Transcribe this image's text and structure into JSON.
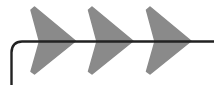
{
  "figure": {
    "title": "",
    "type": "flow-direction-diagram",
    "width": 214,
    "height": 85,
    "background_color": "#ffffff"
  },
  "colors": {
    "chevron_fill": "#8a8a8a",
    "line_stroke": "#222222",
    "background": "#ffffff"
  },
  "path_line": {
    "name": "flow-line",
    "stroke_width": 2.4,
    "description": "horizontal line running to the right edge, curving downward at the left end into a vertical tail",
    "d": "M214 41.5 L22 41.5 C15.5 41.5 11.5 45.5 11.5 52.5 L11.5 85"
  },
  "chevrons": [
    {
      "name": "chevron-1",
      "points": "34.5,7 75.5,41 34.5,74 31,71.5 39.5,41.5 31,10",
      "tip_x": 75.5,
      "tip_y": 41
    },
    {
      "name": "chevron-2",
      "points": "92,7 133,41 92,74 88.5,71.5 97,41.5 88.5,10",
      "tip_x": 133,
      "tip_y": 41
    },
    {
      "name": "chevron-3",
      "points": "150,7 191,41 150,74 146.5,71.5 155,41.5 146.5,10",
      "tip_x": 191,
      "tip_y": 41
    }
  ]
}
